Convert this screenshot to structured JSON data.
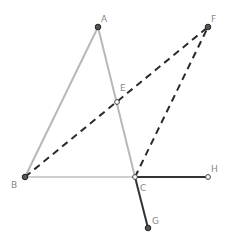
{
  "diagram": {
    "width": 227,
    "height": 243,
    "colors": {
      "triangle_edge": "#b8b8b8",
      "base_edge": "#cfcfcf",
      "dashed": "#2a2a2a",
      "solid_dark": "#333333",
      "point_fill": "#555555",
      "point_stroke": "#222222",
      "label": "#888888"
    },
    "points": {
      "A": {
        "label": "A",
        "x": 98,
        "y": 27,
        "lx": 101,
        "ly": 22
      },
      "B": {
        "label": "B",
        "x": 25,
        "y": 177,
        "lx": 11,
        "ly": 188
      },
      "C": {
        "label": "C",
        "x": 135,
        "y": 177,
        "lx": 140,
        "ly": 191
      },
      "E": {
        "label": "E",
        "x": 117,
        "y": 102,
        "lx": 120,
        "ly": 91
      },
      "F": {
        "label": "F",
        "x": 208,
        "y": 27,
        "lx": 211,
        "ly": 22
      },
      "G": {
        "label": "G",
        "x": 148,
        "y": 228,
        "lx": 152,
        "ly": 224
      },
      "H": {
        "label": "H",
        "x": 208,
        "y": 177,
        "lx": 211,
        "ly": 172
      }
    },
    "segments": [
      {
        "from": "A",
        "to": "B",
        "style": "solid-gray"
      },
      {
        "from": "A",
        "to": "C",
        "style": "solid-gray"
      },
      {
        "from": "B",
        "to": "C",
        "style": "solid-light"
      },
      {
        "from": "B",
        "to": "F",
        "style": "dashed"
      },
      {
        "from": "C",
        "to": "F",
        "style": "dashed"
      },
      {
        "from": "C",
        "to": "H",
        "style": "solid-dark"
      },
      {
        "from": "C",
        "to": "G",
        "style": "solid-dark"
      }
    ]
  }
}
